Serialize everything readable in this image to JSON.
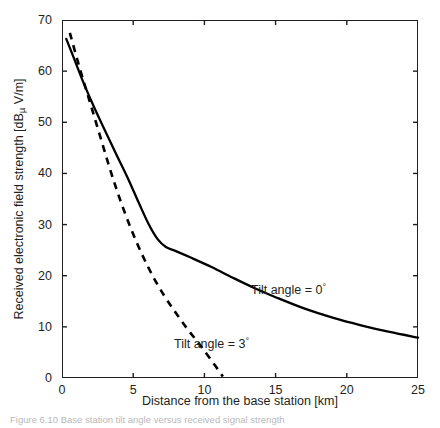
{
  "figure": {
    "caption": "Figure 6.10  Base station tilt angle versus received signal strength"
  },
  "chart_data": {
    "type": "line",
    "title": "",
    "xlabel": "Distance from the base station [km]",
    "ylabel": "Received electronic field strength [dBµ V/m]",
    "ylabel_prefix": "Received electronic field strength [dB",
    "ylabel_mu": "µ",
    "ylabel_suffix": " V/m]",
    "xlim": [
      0,
      25
    ],
    "ylim": [
      0,
      70
    ],
    "xticks": [
      0,
      5,
      10,
      15,
      20,
      25
    ],
    "yticks": [
      0,
      10,
      20,
      30,
      40,
      50,
      60,
      70
    ],
    "xtick_labels": [
      "0",
      "5",
      "10",
      "15",
      "20",
      "25"
    ],
    "ytick_labels": [
      "0",
      "10",
      "20",
      "30",
      "40",
      "50",
      "60",
      "70"
    ],
    "grid": false,
    "legend_position": "inline-annotation",
    "series": [
      {
        "name": "Tilt angle = 0°",
        "style": "solid",
        "color": "#000000",
        "x": [
          0.3,
          0.8,
          1.5,
          2.2,
          3.0,
          3.8,
          4.6,
          5.4,
          6.1,
          6.7,
          7.3,
          8.0,
          9.0,
          10.5,
          12.0,
          13.5,
          15.0,
          17.0,
          19.0,
          21.0,
          23.0,
          25.0
        ],
        "y": [
          66.3,
          62.8,
          57.8,
          53.3,
          48.5,
          43.8,
          39.2,
          34.2,
          30.0,
          27.2,
          25.6,
          24.8,
          23.6,
          21.7,
          19.6,
          17.6,
          15.8,
          13.6,
          11.8,
          10.3,
          9.0,
          7.9
        ]
      },
      {
        "name": "Tilt angle = 3°",
        "style": "dashed",
        "color": "#000000",
        "x": [
          0.55,
          1.2,
          1.9,
          2.6,
          3.3,
          4.0,
          4.8,
          5.6,
          6.4,
          7.2,
          8.0,
          8.8,
          9.6,
          10.4,
          11.3
        ],
        "y": [
          67.5,
          61.0,
          54.5,
          48.0,
          41.5,
          35.5,
          29.5,
          24.3,
          19.8,
          16.0,
          12.7,
          9.6,
          6.8,
          3.8,
          0.3
        ]
      }
    ],
    "annotations": [
      {
        "name": "tilt-0-label",
        "text_prefix": "Tilt angle = 0",
        "degree": "°",
        "x_px": 251,
        "y_px": 282
      },
      {
        "name": "tilt-3-label",
        "text_prefix": "Tilt angle = 3",
        "degree": "°",
        "x_px": 174,
        "y_px": 336
      }
    ]
  }
}
